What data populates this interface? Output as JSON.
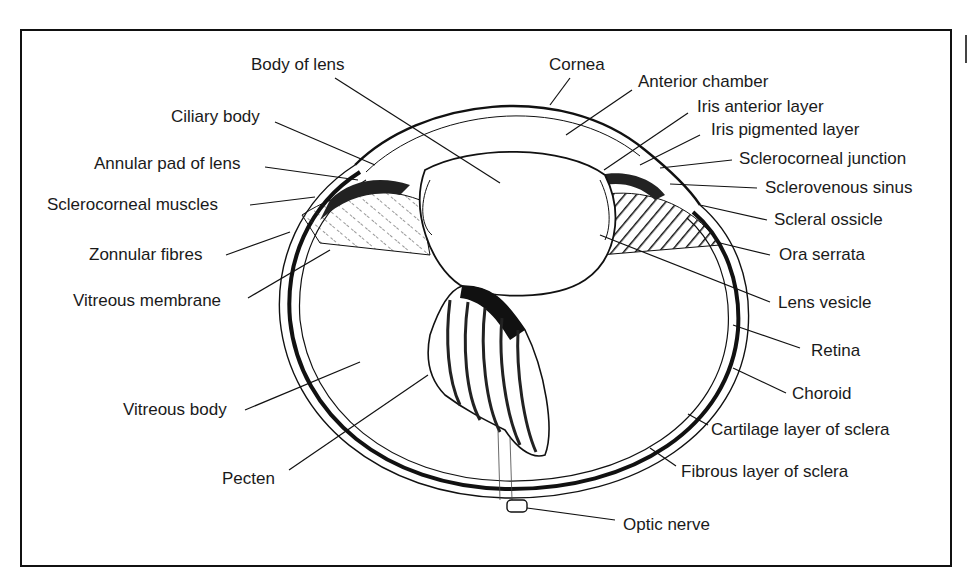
{
  "figure": {
    "colors": {
      "ink": "#111111",
      "background": "#ffffff"
    },
    "labels": {
      "body_of_lens": "Body of lens",
      "cornea": "Cornea",
      "anterior_chamber": "Anterior chamber",
      "ciliary_body": "Ciliary body",
      "iris_anterior_layer": "Iris anterior layer",
      "iris_pigmented_layer": "Iris pigmented layer",
      "annular_pad_of_lens": "Annular pad of lens",
      "sclerocorneal_junction": "Sclerocorneal junction",
      "sclerocorneal_muscles": "Sclerocorneal muscles",
      "sclerovenous_sinus": "Sclerovenous sinus",
      "scleral_ossicle": "Scleral ossicle",
      "zonnular_fibres": "Zonnular fibres",
      "ora_serrata": "Ora serrata",
      "vitreous_membrane": "Vitreous membrane",
      "lens_vesicle": "Lens vesicle",
      "retina": "Retina",
      "choroid": "Choroid",
      "vitreous_body": "Vitreous body",
      "cartilage_layer_of_sclera": "Cartilage layer of sclera",
      "pecten": "Pecten",
      "fibrous_layer_of_sclera": "Fibrous layer of sclera",
      "optic_nerve": "Optic nerve"
    }
  }
}
